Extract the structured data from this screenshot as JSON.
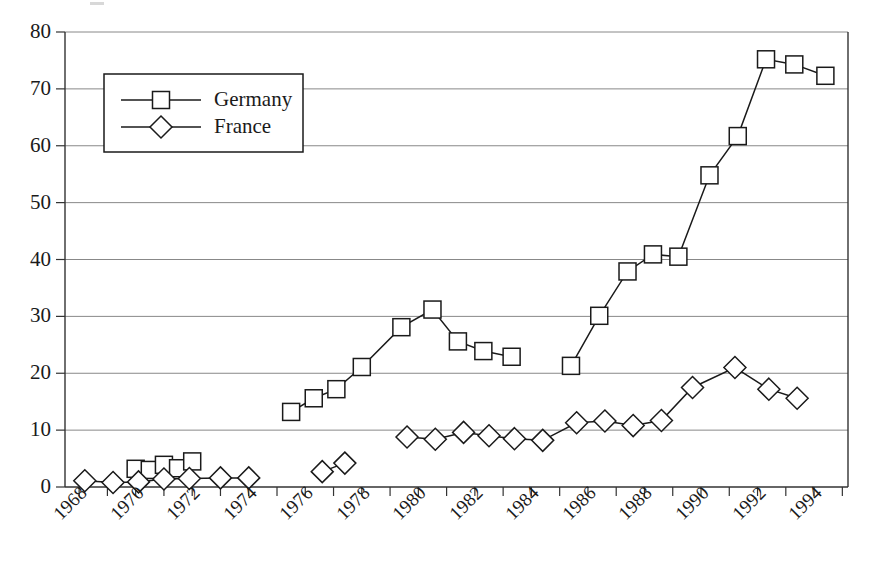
{
  "chart_data": {
    "type": "line",
    "title": "",
    "xlabel": "",
    "ylabel": "",
    "xlim": [
      1967.5,
      1995.2
    ],
    "ylim": [
      0,
      80
    ],
    "ytick_step": 10,
    "yticks": [
      0,
      10,
      20,
      30,
      40,
      50,
      60,
      70,
      80
    ],
    "xticks": [
      1968,
      1970,
      1972,
      1974,
      1976,
      1978,
      1980,
      1982,
      1984,
      1986,
      1988,
      1990,
      1992,
      1994
    ],
    "xtick_labels": [
      "1968",
      "1970",
      "1972",
      "1974",
      "1976",
      "1978",
      "1980",
      "1982",
      "1984",
      "1986",
      "1988",
      "1990",
      "1992",
      "1994"
    ],
    "grid": "horizontal",
    "legend_position": "top-left",
    "series": [
      {
        "name": "Germany",
        "marker": "square",
        "color": "#1a1a1a",
        "segments": [
          {
            "points": [
              {
                "x": 1970.0,
                "y": 3.2
              },
              {
                "x": 1970.5,
                "y": 3.0
              },
              {
                "x": 1971.0,
                "y": 3.9
              },
              {
                "x": 1971.5,
                "y": 3.3
              },
              {
                "x": 1972.0,
                "y": 4.5
              }
            ]
          },
          {
            "points": [
              {
                "x": 1975.5,
                "y": 13.2
              },
              {
                "x": 1976.3,
                "y": 15.6
              },
              {
                "x": 1977.1,
                "y": 17.2
              },
              {
                "x": 1978.0,
                "y": 21.1
              },
              {
                "x": 1979.4,
                "y": 28.1
              },
              {
                "x": 1980.5,
                "y": 31.2
              },
              {
                "x": 1981.4,
                "y": 25.6
              },
              {
                "x": 1982.3,
                "y": 23.9
              },
              {
                "x": 1983.3,
                "y": 22.9
              }
            ]
          },
          {
            "points": [
              {
                "x": 1985.4,
                "y": 21.3
              },
              {
                "x": 1986.4,
                "y": 30.1
              },
              {
                "x": 1987.4,
                "y": 37.9
              },
              {
                "x": 1988.3,
                "y": 40.9
              },
              {
                "x": 1989.2,
                "y": 40.5
              },
              {
                "x": 1990.3,
                "y": 54.8
              },
              {
                "x": 1991.3,
                "y": 61.7
              },
              {
                "x": 1992.3,
                "y": 75.2
              },
              {
                "x": 1993.3,
                "y": 74.3
              },
              {
                "x": 1994.4,
                "y": 72.3
              }
            ]
          }
        ]
      },
      {
        "name": "France",
        "marker": "diamond",
        "color": "#1a1a1a",
        "segments": [
          {
            "points": [
              {
                "x": 1968.2,
                "y": 1.1
              },
              {
                "x": 1969.2,
                "y": 0.8
              },
              {
                "x": 1970.1,
                "y": 0.9
              },
              {
                "x": 1971.0,
                "y": 1.4
              },
              {
                "x": 1971.9,
                "y": 1.5
              },
              {
                "x": 1973.0,
                "y": 1.6
              },
              {
                "x": 1974.0,
                "y": 1.6
              }
            ]
          },
          {
            "points": [
              {
                "x": 1976.6,
                "y": 2.7
              },
              {
                "x": 1977.4,
                "y": 4.2
              }
            ]
          },
          {
            "points": [
              {
                "x": 1979.6,
                "y": 8.8
              },
              {
                "x": 1980.6,
                "y": 8.4
              },
              {
                "x": 1981.6,
                "y": 9.6
              },
              {
                "x": 1982.5,
                "y": 9.0
              },
              {
                "x": 1983.4,
                "y": 8.5
              },
              {
                "x": 1984.4,
                "y": 8.2
              },
              {
                "x": 1985.6,
                "y": 11.3
              },
              {
                "x": 1986.6,
                "y": 11.6
              },
              {
                "x": 1987.6,
                "y": 10.8
              },
              {
                "x": 1988.6,
                "y": 11.7
              },
              {
                "x": 1989.7,
                "y": 17.5
              },
              {
                "x": 1991.2,
                "y": 21.0
              },
              {
                "x": 1992.4,
                "y": 17.2
              },
              {
                "x": 1993.4,
                "y": 15.6
              }
            ]
          }
        ]
      }
    ],
    "legend": {
      "entries": [
        {
          "label": "Germany",
          "marker": "square"
        },
        {
          "label": "France",
          "marker": "diamond"
        }
      ]
    }
  }
}
